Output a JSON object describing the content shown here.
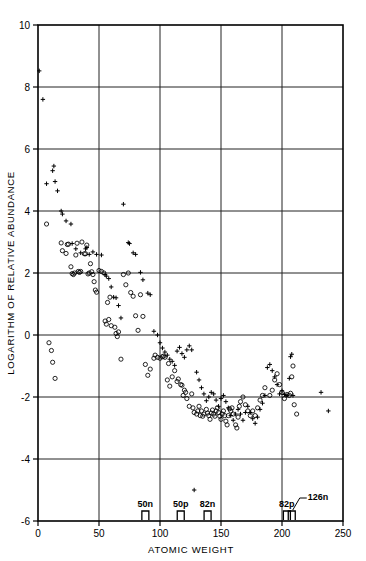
{
  "figure": {
    "background_color": "#ffffff",
    "ink_color": "#000000"
  },
  "chart_data": {
    "type": "scatter",
    "title": "",
    "xlabel": "ATOMIC WEIGHT",
    "ylabel": "LOGARITHM OF RELATIVE ABUNDANCE",
    "xlim": [
      0,
      250
    ],
    "ylim": [
      -6,
      10
    ],
    "xticks": [
      0,
      50,
      100,
      150,
      200,
      250
    ],
    "xtick_labels": [
      "0",
      "50",
      "100",
      "150",
      "200",
      "250"
    ],
    "yticks": [
      -6,
      -4,
      -2,
      0,
      2,
      4,
      6,
      8,
      10
    ],
    "ytick_labels": [
      "-6",
      "-4",
      "-2",
      "0",
      "2",
      "4",
      "6",
      "8",
      "10"
    ],
    "grid": true,
    "grid_x_values": [
      50,
      100,
      150,
      200
    ],
    "grid_y_values": [
      -4,
      -2,
      0,
      2,
      4,
      6,
      8
    ],
    "legend": null,
    "legend_position": "none",
    "series": [
      {
        "name": "open-circle-series",
        "marker": "circle",
        "points": [
          [
            7,
            3.58
          ],
          [
            9,
            -0.25
          ],
          [
            11,
            -0.5
          ],
          [
            12,
            -0.88
          ],
          [
            14,
            -1.4
          ],
          [
            19,
            2.97
          ],
          [
            20,
            2.72
          ],
          [
            23,
            2.63
          ],
          [
            24,
            2.92
          ],
          [
            25,
            2.93
          ],
          [
            27,
            2.2
          ],
          [
            28,
            1.98
          ],
          [
            29,
            1.95
          ],
          [
            30,
            2.0
          ],
          [
            31,
            2.58
          ],
          [
            32,
            2.96
          ],
          [
            33,
            2.05
          ],
          [
            34,
            2.02
          ],
          [
            35,
            2.05
          ],
          [
            36,
            3.0
          ],
          [
            38,
            2.62
          ],
          [
            39,
            2.62
          ],
          [
            40,
            2.9
          ],
          [
            41,
            1.97
          ],
          [
            42,
            2.0
          ],
          [
            43,
            2.3
          ],
          [
            44,
            2.04
          ],
          [
            45,
            1.95
          ],
          [
            46,
            1.72
          ],
          [
            47,
            1.45
          ],
          [
            48,
            1.38
          ],
          [
            50,
            2.08
          ],
          [
            52,
            2.05
          ],
          [
            54,
            2.0
          ],
          [
            55,
            0.45
          ],
          [
            56,
            0.35
          ],
          [
            57,
            1.05
          ],
          [
            58,
            0.5
          ],
          [
            59,
            1.22
          ],
          [
            60,
            0.3
          ],
          [
            63,
            0.25
          ],
          [
            64,
            0.05
          ],
          [
            65,
            -0.05
          ],
          [
            66,
            0.1
          ],
          [
            68,
            -0.78
          ],
          [
            70,
            1.95
          ],
          [
            72,
            1.62
          ],
          [
            74,
            2.0
          ],
          [
            76,
            1.37
          ],
          [
            78,
            1.25
          ],
          [
            80,
            0.62
          ],
          [
            82,
            0.15
          ],
          [
            84,
            1.3
          ],
          [
            86,
            0.6
          ],
          [
            88,
            -0.95
          ],
          [
            90,
            -1.3
          ],
          [
            92,
            -1.1
          ],
          [
            95,
            -0.75
          ],
          [
            96,
            -0.65
          ],
          [
            98,
            -0.72
          ],
          [
            100,
            -0.75
          ],
          [
            102,
            -0.7
          ],
          [
            103,
            -0.68
          ],
          [
            104,
            -0.72
          ],
          [
            106,
            -1.45
          ],
          [
            107,
            -0.92
          ],
          [
            108,
            -1.65
          ],
          [
            110,
            -1.35
          ],
          [
            112,
            -1.15
          ],
          [
            114,
            -1.5
          ],
          [
            115,
            -1.42
          ],
          [
            117,
            -1.6
          ],
          [
            118,
            -1.62
          ],
          [
            119,
            -1.95
          ],
          [
            120,
            -1.78
          ],
          [
            121,
            -1.85
          ],
          [
            122,
            -2.05
          ],
          [
            124,
            -2.3
          ],
          [
            126,
            -1.9
          ],
          [
            127,
            -2.35
          ],
          [
            128,
            -2.5
          ],
          [
            130,
            -2.55
          ],
          [
            131,
            -2.45
          ],
          [
            132,
            -2.3
          ],
          [
            133,
            -2.6
          ],
          [
            134,
            -2.45
          ],
          [
            135,
            -2.62
          ],
          [
            136,
            -2.55
          ],
          [
            138,
            -2.4
          ],
          [
            139,
            -2.52
          ],
          [
            140,
            -2.6
          ],
          [
            141,
            -2.72
          ],
          [
            142,
            -2.52
          ],
          [
            143,
            -2.42
          ],
          [
            144,
            -2.55
          ],
          [
            145,
            -2.62
          ],
          [
            146,
            -2.45
          ],
          [
            147,
            -2.35
          ],
          [
            148,
            -2.5
          ],
          [
            149,
            -2.62
          ],
          [
            150,
            -2.72
          ],
          [
            151,
            -2.55
          ],
          [
            152,
            -2.45
          ],
          [
            153,
            -2.6
          ],
          [
            154,
            -2.78
          ],
          [
            155,
            -2.9
          ],
          [
            156,
            -2.6
          ],
          [
            157,
            -2.38
          ],
          [
            158,
            -2.45
          ],
          [
            159,
            -2.35
          ],
          [
            160,
            -2.55
          ],
          [
            162,
            -2.9
          ],
          [
            163,
            -3.0
          ],
          [
            164,
            -2.65
          ],
          [
            165,
            -2.3
          ],
          [
            166,
            -2.15
          ],
          [
            168,
            -2.0
          ],
          [
            170,
            -2.25
          ],
          [
            172,
            -2.45
          ],
          [
            174,
            -2.6
          ],
          [
            176,
            -2.45
          ],
          [
            178,
            -2.6
          ],
          [
            180,
            -2.35
          ],
          [
            182,
            -2.1
          ],
          [
            184,
            -1.95
          ],
          [
            186,
            -1.7
          ],
          [
            190,
            -1.95
          ],
          [
            192,
            -1.78
          ],
          [
            194,
            -1.45
          ],
          [
            196,
            -1.25
          ],
          [
            198,
            -1.6
          ],
          [
            200,
            -1.85
          ],
          [
            202,
            -2.05
          ],
          [
            204,
            -1.92
          ],
          [
            206,
            -1.95
          ],
          [
            207,
            -1.88
          ],
          [
            208,
            -1.35
          ],
          [
            209,
            -1.0
          ],
          [
            210,
            -2.25
          ],
          [
            212,
            -2.55
          ]
        ]
      },
      {
        "name": "plus-series",
        "marker": "plus",
        "points": [
          [
            1,
            8.52
          ],
          [
            4,
            7.6
          ],
          [
            7,
            4.88
          ],
          [
            12,
            5.3
          ],
          [
            13,
            5.45
          ],
          [
            14,
            4.95
          ],
          [
            16,
            4.65
          ],
          [
            19,
            4.0
          ],
          [
            20,
            3.9
          ],
          [
            23,
            3.68
          ],
          [
            27,
            3.58
          ],
          [
            28,
            2.95
          ],
          [
            31,
            2.78
          ],
          [
            35,
            2.65
          ],
          [
            39,
            2.78
          ],
          [
            40,
            2.82
          ],
          [
            42,
            2.6
          ],
          [
            45,
            2.68
          ],
          [
            48,
            2.6
          ],
          [
            52,
            2.58
          ],
          [
            55,
            1.95
          ],
          [
            56,
            1.9
          ],
          [
            58,
            1.82
          ],
          [
            60,
            1.55
          ],
          [
            62,
            1.22
          ],
          [
            64,
            1.2
          ],
          [
            66,
            0.95
          ],
          [
            68,
            0.55
          ],
          [
            70,
            4.22
          ],
          [
            74,
            2.98
          ],
          [
            75,
            2.95
          ],
          [
            78,
            2.65
          ],
          [
            80,
            2.6
          ],
          [
            84,
            2.02
          ],
          [
            86,
            1.78
          ],
          [
            90,
            1.35
          ],
          [
            92,
            1.3
          ],
          [
            95,
            0.12
          ],
          [
            98,
            0.0
          ],
          [
            100,
            -0.25
          ],
          [
            102,
            -0.42
          ],
          [
            104,
            -0.55
          ],
          [
            106,
            -0.65
          ],
          [
            108,
            -0.78
          ],
          [
            110,
            -0.85
          ],
          [
            112,
            -0.98
          ],
          [
            114,
            -0.52
          ],
          [
            116,
            -0.4
          ],
          [
            118,
            -0.6
          ],
          [
            120,
            -0.72
          ],
          [
            122,
            -0.48
          ],
          [
            124,
            -0.35
          ],
          [
            126,
            -0.48
          ],
          [
            128,
            -5.0
          ],
          [
            130,
            -1.2
          ],
          [
            132,
            -1.45
          ],
          [
            134,
            -1.7
          ],
          [
            136,
            -1.9
          ],
          [
            138,
            -2.12
          ],
          [
            140,
            -2.0
          ],
          [
            142,
            -1.85
          ],
          [
            144,
            -1.9
          ],
          [
            146,
            -2.1
          ],
          [
            148,
            -2.3
          ],
          [
            150,
            -2.05
          ],
          [
            152,
            -1.95
          ],
          [
            154,
            -2.15
          ],
          [
            156,
            -2.35
          ],
          [
            158,
            -2.6
          ],
          [
            160,
            -2.75
          ],
          [
            162,
            -2.55
          ],
          [
            164,
            -2.4
          ],
          [
            166,
            -2.55
          ],
          [
            168,
            -2.75
          ],
          [
            170,
            -2.5
          ],
          [
            172,
            -2.3
          ],
          [
            174,
            -2.5
          ],
          [
            176,
            -2.7
          ],
          [
            178,
            -2.85
          ],
          [
            180,
            -2.65
          ],
          [
            182,
            -2.4
          ],
          [
            184,
            -2.2
          ],
          [
            186,
            -1.95
          ],
          [
            188,
            -1.05
          ],
          [
            190,
            -0.95
          ],
          [
            192,
            -1.15
          ],
          [
            194,
            -1.35
          ],
          [
            196,
            -1.6
          ],
          [
            198,
            -1.9
          ],
          [
            200,
            -1.8
          ],
          [
            202,
            -1.92
          ],
          [
            204,
            -1.95
          ],
          [
            206,
            -1.4
          ],
          [
            207,
            -0.7
          ],
          [
            208,
            -0.62
          ],
          [
            209,
            -1.95
          ],
          [
            232,
            -1.85
          ],
          [
            238,
            -2.45
          ]
        ]
      }
    ],
    "annotations": [
      {
        "label": "50n",
        "x": 88,
        "type": "magic-bracket",
        "leader": false
      },
      {
        "label": "50p",
        "x": 117,
        "type": "magic-bracket",
        "leader": false
      },
      {
        "label": "82n",
        "x": 139,
        "type": "magic-bracket",
        "leader": false
      },
      {
        "label": "82p",
        "x": 204,
        "type": "magic-bracket",
        "leader": false
      },
      {
        "label": "126n",
        "x": 208,
        "type": "magic-bracket",
        "leader": true
      }
    ]
  }
}
